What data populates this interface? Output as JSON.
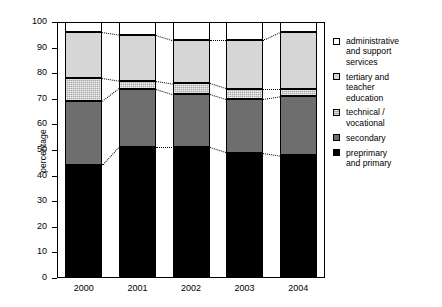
{
  "chart_data": {
    "type": "bar",
    "subtype": "stacked-bar-100",
    "title": "",
    "subtitle": "",
    "xlabel": "",
    "ylabel": "percentage",
    "categories": [
      "2000",
      "2001",
      "2002",
      "2003",
      "2004"
    ],
    "ylim": [
      0,
      100
    ],
    "yticks": [
      0,
      10,
      20,
      30,
      40,
      50,
      60,
      70,
      80,
      90,
      100
    ],
    "ytick_labels": [
      "0",
      "10",
      "20",
      "30",
      "40",
      "50",
      "60",
      "70",
      "80",
      "90",
      "100"
    ],
    "grid": false,
    "legend_position": "right",
    "connector_lines": true,
    "series": [
      {
        "name": "preprimary and primary",
        "key": "preprimary",
        "color": "#000000",
        "values": [
          44,
          51,
          51,
          49,
          48
        ],
        "cumulative_tops": [
          44,
          51,
          51,
          49,
          48
        ]
      },
      {
        "name": "secondary",
        "key": "secondary",
        "color": "#6e6e6e",
        "values": [
          25,
          23,
          21,
          21,
          23
        ],
        "cumulative_tops": [
          69,
          74,
          72,
          70,
          71
        ]
      },
      {
        "name": "technical / vocational",
        "key": "technical",
        "color": "#a8a8a8",
        "values": [
          9,
          3,
          4,
          4,
          3
        ],
        "cumulative_tops": [
          78,
          77,
          76,
          74,
          74
        ]
      },
      {
        "name": "tertiary and teacher education",
        "key": "tertiary",
        "color": "#d6d6d6",
        "values": [
          18,
          18,
          17,
          19,
          22
        ],
        "cumulative_tops": [
          96,
          95,
          93,
          93,
          96
        ]
      },
      {
        "name": "administrative and support services",
        "key": "administrative",
        "color": "#ffffff",
        "values": [
          4,
          5,
          7,
          7,
          4
        ],
        "cumulative_tops": [
          100,
          100,
          100,
          100,
          100
        ]
      }
    ]
  },
  "legend": {
    "items": [
      {
        "label": "administrative\nand support\nservices",
        "key": "administrative"
      },
      {
        "label": "tertiary and\nteacher\neducation",
        "key": "tertiary"
      },
      {
        "label": "technical /\nvocational",
        "key": "technical"
      },
      {
        "label": "secondary",
        "key": "secondary"
      },
      {
        "label": "preprimary\nand primary",
        "key": "preprimary"
      }
    ]
  }
}
